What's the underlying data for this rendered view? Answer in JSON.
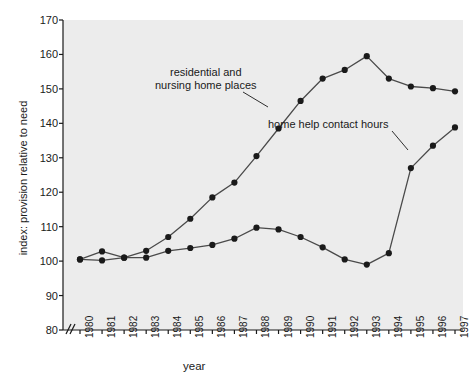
{
  "chart_data": {
    "type": "line",
    "title": "",
    "xlabel": "year",
    "ylabel": "index: provision relative to need",
    "x": [
      1980,
      1981,
      1982,
      1983,
      1984,
      1985,
      1986,
      1987,
      1988,
      1989,
      1990,
      1991,
      1992,
      1993,
      1994,
      1995,
      1996,
      1997
    ],
    "categories": [
      "1980",
      "1981",
      "1982",
      "1983",
      "1984",
      "1985",
      "1986",
      "1987",
      "1988",
      "1989",
      "1990",
      "1991",
      "1992",
      "1993",
      "1994",
      "1995",
      "1996",
      "1997"
    ],
    "ylim": [
      80,
      170
    ],
    "yticks": [
      80,
      90,
      100,
      110,
      120,
      130,
      140,
      150,
      160,
      170
    ],
    "axis_break": true,
    "grid": false,
    "legend_position": "inline-annotations",
    "series": [
      {
        "name": "residential and nursing home places",
        "values": [
          100.5,
          100.2,
          101.0,
          103.0,
          107.0,
          112.3,
          118.5,
          122.8,
          130.5,
          138.5,
          146.5,
          153.0,
          155.5,
          159.5,
          153.0,
          150.7,
          150.2,
          149.3
        ],
        "color": "#2b2b2b"
      },
      {
        "name": "home help contact hours",
        "values": [
          100.5,
          102.8,
          101.0,
          101.0,
          103.0,
          103.8,
          104.7,
          106.5,
          109.7,
          109.2,
          107.0,
          104.0,
          100.5,
          99.0,
          102.3,
          127.0,
          133.5,
          138.8
        ],
        "color": "#2b2b2b"
      }
    ],
    "annotations": [
      {
        "id": "residential",
        "line1": "residential and",
        "line2": "nursing home places"
      },
      {
        "id": "homehelp",
        "text": "home help contact hours"
      }
    ]
  },
  "colors": {
    "plot_background": "#ececec",
    "axis": "#1a1a1a",
    "line": "#4a4a4a",
    "marker": "#1a1a1a"
  }
}
